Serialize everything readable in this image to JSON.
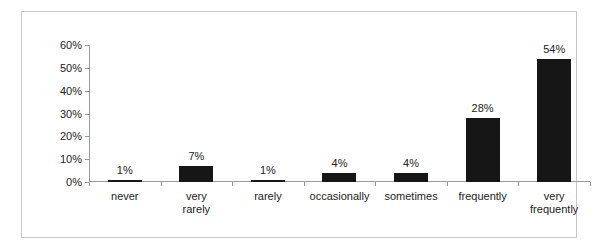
{
  "chart_data": {
    "type": "bar",
    "title": "",
    "subtitle": "",
    "xlabel": "",
    "ylabel": "",
    "categories": [
      "never",
      "very rarely",
      "rarely",
      "occasionally",
      "sometimes",
      "frequently",
      "very\nfrequently"
    ],
    "values": [
      1,
      7,
      1,
      4,
      4,
      28,
      54
    ],
    "data_labels": [
      "1%",
      "7%",
      "1%",
      "4%",
      "4%",
      "28%",
      "54%"
    ],
    "ylim": [
      0,
      60
    ],
    "ytick_values": [
      0,
      10,
      20,
      30,
      40,
      50,
      60
    ],
    "ytick_labels": [
      "0%",
      "10%",
      "20%",
      "30%",
      "40%",
      "50%",
      "60%"
    ],
    "grid": false,
    "legend": "none",
    "bar_color": "#161616",
    "axis_color": "#9a9a9a",
    "text_color": "#222222",
    "border_color": "#c8c8c8",
    "background": "#ffffff"
  }
}
